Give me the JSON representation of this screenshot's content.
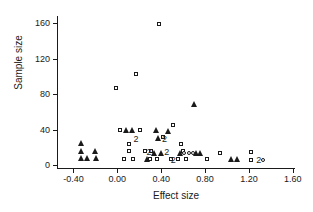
{
  "chart_data": {
    "type": "scatter",
    "title": "",
    "xlabel": "Effect size",
    "ylabel": "Sample size",
    "xlim": [
      -0.55,
      1.62
    ],
    "ylim": [
      -3,
      168
    ],
    "grid": false,
    "legend": null,
    "xticks": [
      "-0.40",
      "0.00",
      "0.40",
      "0.80",
      "1.20",
      "1.60"
    ],
    "xtick_values": [
      -0.4,
      0.0,
      0.4,
      0.8,
      1.2,
      1.6
    ],
    "yticks": [
      "0",
      "40",
      "80",
      "120",
      "160"
    ],
    "ytick_values": [
      0,
      40,
      80,
      120,
      160
    ],
    "series": [
      {
        "name": "open-square",
        "marker": "square",
        "points": [
          [
            -0.01,
            87
          ],
          [
            0.17,
            103
          ],
          [
            0.38,
            159
          ],
          [
            0.02,
            40
          ],
          [
            0.21,
            40
          ],
          [
            0.51,
            45
          ],
          [
            0.42,
            32
          ],
          [
            0.11,
            24
          ],
          [
            0.58,
            24
          ],
          [
            0.11,
            16
          ],
          [
            0.25,
            16
          ],
          [
            0.31,
            16
          ],
          [
            0.6,
            16
          ],
          [
            0.06,
            7
          ],
          [
            0.14,
            7
          ],
          [
            0.3,
            7
          ],
          [
            0.36,
            7
          ],
          [
            0.49,
            7
          ],
          [
            0.55,
            7
          ],
          [
            0.63,
            7
          ],
          [
            0.82,
            7
          ],
          [
            0.94,
            14
          ],
          [
            1.22,
            15
          ],
          [
            1.22,
            6
          ]
        ]
      },
      {
        "name": "open-circle",
        "marker": "circle",
        "points": [
          [
            0.61,
            14
          ],
          [
            0.65,
            14
          ],
          [
            0.69,
            14
          ],
          [
            1.33,
            6
          ]
        ]
      },
      {
        "name": "filled-triangle",
        "marker": "triangle",
        "points": [
          [
            -0.33,
            25
          ],
          [
            -0.33,
            16
          ],
          [
            -0.33,
            8
          ],
          [
            -0.28,
            8
          ],
          [
            -0.2,
            16
          ],
          [
            -0.19,
            8
          ],
          [
            0.08,
            40
          ],
          [
            0.13,
            40
          ],
          [
            0.35,
            40
          ],
          [
            0.37,
            31
          ],
          [
            0.46,
            39
          ],
          [
            0.7,
            69
          ],
          [
            0.27,
            7
          ],
          [
            0.33,
            14
          ],
          [
            0.4,
            14
          ],
          [
            0.57,
            14
          ],
          [
            0.72,
            14
          ],
          [
            0.75,
            14
          ],
          [
            1.04,
            7
          ],
          [
            1.09,
            7
          ]
        ]
      },
      {
        "name": "overlap-count-labels",
        "marker": "text",
        "points": [
          [
            0.17,
            30,
            "2"
          ],
          [
            0.43,
            30,
            "2"
          ],
          [
            0.29,
            15,
            "2"
          ],
          [
            0.45,
            15,
            "2"
          ],
          [
            0.51,
            6,
            "2"
          ],
          [
            1.29,
            6,
            "2"
          ]
        ]
      }
    ]
  }
}
